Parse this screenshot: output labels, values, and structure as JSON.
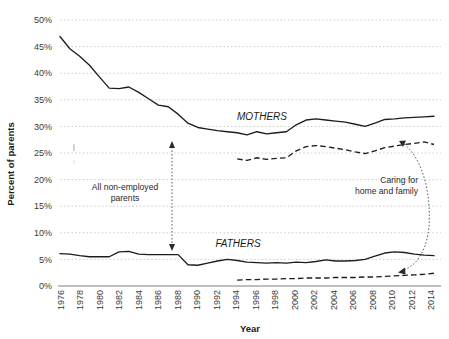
{
  "chart_data": {
    "type": "line",
    "title": "",
    "xlabel": "Year",
    "ylabel": "Percent of parents",
    "xlim": [
      1976,
      2014
    ],
    "ylim": [
      0,
      50
    ],
    "grid": true,
    "legend_position": "inline-annotations",
    "ytick_labels": [
      "0%",
      "5%",
      "10%",
      "15%",
      "20%",
      "25%",
      "30%",
      "35%",
      "40%",
      "45%",
      "50%"
    ],
    "ytick_values": [
      0,
      5,
      10,
      15,
      20,
      25,
      30,
      35,
      40,
      45,
      50
    ],
    "xtick_labels": [
      "1976",
      "1978",
      "1980",
      "1982",
      "1984",
      "1986",
      "1988",
      "1990",
      "1992",
      "1994",
      "1996",
      "1998",
      "2000",
      "2002",
      "2004",
      "2006",
      "2008",
      "2010",
      "2012",
      "2014"
    ],
    "xtick_values": [
      1976,
      1978,
      1980,
      1982,
      1984,
      1986,
      1988,
      1990,
      1992,
      1994,
      1996,
      1998,
      2000,
      2002,
      2004,
      2006,
      2008,
      2010,
      2012,
      2014
    ],
    "series": [
      {
        "name": "Mothers — all non-employed parents",
        "group": "MOTHERS",
        "style": "solid",
        "color": "#1d1d1d",
        "x": [
          1976,
          1977,
          1978,
          1979,
          1980,
          1981,
          1982,
          1983,
          1984,
          1985,
          1986,
          1987,
          1988,
          1989,
          1990,
          1991,
          1992,
          1993,
          1994,
          1995,
          1996,
          1997,
          1998,
          1999,
          2000,
          2001,
          2002,
          2003,
          2004,
          2005,
          2006,
          2007,
          2008,
          2009,
          2010,
          2011,
          2012,
          2013,
          2014
        ],
        "values": [
          46.9,
          44.6,
          43.2,
          41.5,
          39.3,
          37.2,
          37.1,
          37.4,
          36.4,
          35.2,
          34.0,
          33.7,
          32.3,
          30.6,
          29.8,
          29.5,
          29.2,
          29.0,
          28.8,
          28.4,
          29.0,
          28.6,
          28.8,
          29.0,
          30.3,
          31.2,
          31.4,
          31.2,
          31.0,
          30.8,
          30.4,
          30.0,
          30.6,
          31.3,
          31.4,
          31.6,
          31.7,
          31.8,
          31.9
        ]
      },
      {
        "name": "Mothers — caring for home and family",
        "group": "MOTHERS",
        "style": "dashed",
        "color": "#1d1d1d",
        "x": [
          1994,
          1995,
          1996,
          1997,
          1998,
          1999,
          2000,
          2001,
          2002,
          2003,
          2004,
          2005,
          2006,
          2007,
          2008,
          2009,
          2010,
          2011,
          2012,
          2013,
          2014
        ],
        "values": [
          23.9,
          23.6,
          24.1,
          23.8,
          24.0,
          24.1,
          25.4,
          26.2,
          26.4,
          26.2,
          25.9,
          25.6,
          25.2,
          24.9,
          25.4,
          26.0,
          26.3,
          26.6,
          26.8,
          27.1,
          26.6
        ]
      },
      {
        "name": "Fathers — all non-employed parents",
        "group": "FATHERS",
        "style": "solid",
        "color": "#1d1d1d",
        "x": [
          1976,
          1977,
          1978,
          1979,
          1980,
          1981,
          1982,
          1983,
          1984,
          1985,
          1986,
          1987,
          1988,
          1989,
          1990,
          1991,
          1992,
          1993,
          1994,
          1995,
          1996,
          1997,
          1998,
          1999,
          2000,
          2001,
          2002,
          2003,
          2004,
          2005,
          2006,
          2007,
          2008,
          2009,
          2010,
          2011,
          2012,
          2013,
          2014
        ],
        "values": [
          6.1,
          6.0,
          5.7,
          5.5,
          5.5,
          5.5,
          6.4,
          6.5,
          6.0,
          5.9,
          5.9,
          5.9,
          5.9,
          4.0,
          3.9,
          4.3,
          4.7,
          5.0,
          4.8,
          4.5,
          4.4,
          4.3,
          4.4,
          4.3,
          4.5,
          4.4,
          4.6,
          4.9,
          4.7,
          4.7,
          4.8,
          5.0,
          5.6,
          6.2,
          6.4,
          6.3,
          6.0,
          5.8,
          5.7
        ]
      },
      {
        "name": "Fathers — caring for home and family",
        "group": "FATHERS",
        "style": "dashed",
        "color": "#1d1d1d",
        "x": [
          1994,
          1995,
          1996,
          1997,
          1998,
          1999,
          2000,
          2001,
          2002,
          2003,
          2004,
          2005,
          2006,
          2007,
          2008,
          2009,
          2010,
          2011,
          2012,
          2013,
          2014
        ],
        "values": [
          1.1,
          1.2,
          1.2,
          1.3,
          1.3,
          1.4,
          1.4,
          1.5,
          1.5,
          1.5,
          1.6,
          1.6,
          1.6,
          1.7,
          1.7,
          1.8,
          1.9,
          2.0,
          2.1,
          2.2,
          2.4
        ]
      }
    ],
    "annotations": [
      {
        "name": "mothers-label",
        "text": "MOTHERS",
        "x": 262,
        "y": 120
      },
      {
        "name": "fathers-label",
        "text": "FATHERS",
        "x": 238,
        "y": 247
      },
      {
        "name": "all-non-employed-parents-label",
        "text_line1": "All non-employed",
        "text_line2": "parents",
        "x": 125,
        "y": 193
      },
      {
        "name": "caring-for-home-and-family-label",
        "text_line1": "Caring for",
        "text_line2": "home and family",
        "x": 418,
        "y": 186
      }
    ]
  }
}
